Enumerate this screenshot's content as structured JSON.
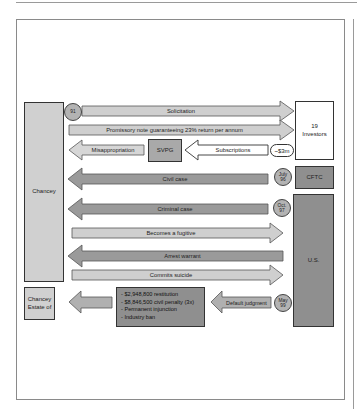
{
  "diagram": {
    "nodes": {
      "chancey": "Chancey",
      "investors": "19\nInvestors",
      "investors_line1": "19",
      "investors_line2": "Investors",
      "svpg": "SVPG",
      "cftc": "CFTC",
      "us": "U.S.",
      "estate_line1": "Chancey",
      "estate_line2": "Estate of",
      "amount": "~$3m"
    },
    "dates": {
      "start": "91",
      "civil_line1": "July",
      "civil_line2": "96",
      "criminal_line1": "Oct.",
      "criminal_line2": "97",
      "judgment_line1": "May",
      "judgment_line2": "99"
    },
    "arrows": {
      "solicitation": "Solicitation",
      "promissory": "Promissory note guaranteeing 23% return per annum",
      "misappropriation": "Misappropriation",
      "subscriptions": "Subscriptions",
      "civil_case": "Civil case",
      "criminal_case": "Criminal case",
      "fugitive": "Becomes a fugitive",
      "arrest": "Arrest warrant",
      "suicide": "Commits suicide",
      "default_judgment": "Default judgment"
    },
    "penalties": [
      "- $2,948,800 restitution",
      "- $8,846,500 civil penalty (3x)",
      "- Permanent injunction",
      "- Industry ban"
    ]
  }
}
